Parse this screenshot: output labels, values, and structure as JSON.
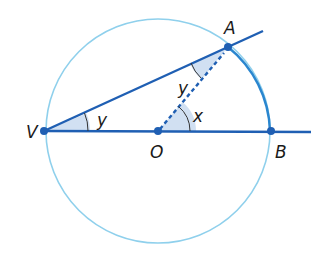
{
  "diagram": {
    "type": "circle-geometry",
    "colors": {
      "circle": "#8fd0ec",
      "line": "#1f5fb3",
      "arc_highlight": "#2a86cf",
      "shade": "#c9daf0",
      "label": "#1a1a1a"
    },
    "circle": {
      "center": "O",
      "cx": 158,
      "cy": 131,
      "r": 112
    },
    "points": [
      {
        "id": "V",
        "label": "V",
        "x": 44,
        "y": 131
      },
      {
        "id": "O",
        "label": "O",
        "x": 158,
        "y": 131
      },
      {
        "id": "A",
        "label": "A",
        "x": 228,
        "y": 47
      },
      {
        "id": "B",
        "label": "B",
        "x": 271,
        "y": 131
      }
    ],
    "angle_labels": {
      "angle_AVB": "y",
      "angle_VAO": "y",
      "angle_AOB": "x"
    },
    "segments": [
      {
        "from": "V",
        "to": "A",
        "style": "solid",
        "extended": true
      },
      {
        "from": "V",
        "to": "B",
        "style": "solid",
        "extended": true
      },
      {
        "from": "O",
        "to": "A",
        "style": "dashed"
      }
    ],
    "highlighted_arc": {
      "from": "A",
      "to": "B"
    }
  }
}
